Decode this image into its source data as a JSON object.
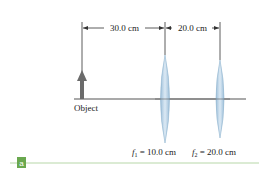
{
  "diagram": {
    "dimension_1": "30.0 cm",
    "dimension_2": "20.0 cm",
    "object_label": "Object",
    "focal_1_symbol": "f",
    "focal_1_sub": "1",
    "focal_1_value": " = 10.0 cm",
    "focal_2_symbol": "f",
    "focal_2_sub": "2",
    "focal_2_value": " = 20.0 cm",
    "panel_label": "a"
  },
  "colors": {
    "axis": "#555555",
    "arrow": "#6b6b6b",
    "lens_fill": "#b9d3e6",
    "lens_edge": "#8fb3cf",
    "panel_green": "#6aa84f",
    "rule_green": "#b7d7a8"
  }
}
